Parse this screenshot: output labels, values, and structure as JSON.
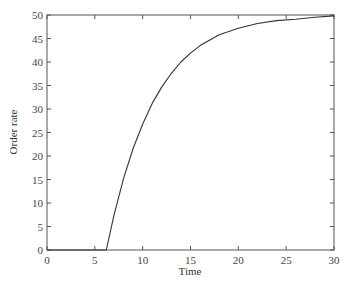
{
  "chart_data": {
    "type": "line",
    "title": "",
    "xlabel": "Time",
    "ylabel": "Order rate",
    "xlim": [
      0,
      30
    ],
    "ylim": [
      0,
      50
    ],
    "xticks": [
      0,
      5,
      10,
      15,
      20,
      25,
      30
    ],
    "yticks": [
      0,
      5,
      10,
      15,
      20,
      25,
      30,
      35,
      40,
      45,
      50
    ],
    "grid": false,
    "legend": null,
    "series": [
      {
        "name": "Order rate",
        "color": "#333333",
        "x": [
          0,
          6.2,
          7,
          8,
          9,
          10,
          11,
          12,
          13,
          14,
          15,
          16,
          18,
          20,
          22,
          24,
          26,
          28,
          30
        ],
        "y": [
          0,
          0,
          7.4,
          15.2,
          21.6,
          26.8,
          31.2,
          34.7,
          37.6,
          40.0,
          41.9,
          43.5,
          45.8,
          47.2,
          48.2,
          48.8,
          49.1,
          49.5,
          49.8
        ]
      }
    ]
  }
}
